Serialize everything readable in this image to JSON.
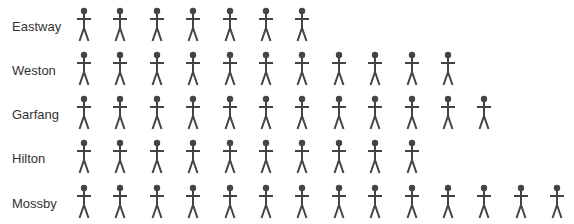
{
  "chart_data": {
    "type": "pictograph",
    "title": "",
    "xlabel": "",
    "ylabel": "",
    "icon": "person-icon",
    "icon_color": "#444444",
    "categories": [
      "Eastway",
      "Weston",
      "Garfang",
      "Hilton",
      "Mossby"
    ],
    "values": [
      7,
      11,
      12,
      10,
      14
    ],
    "legend": null,
    "grid": false
  },
  "rows": [
    {
      "label": "Eastway",
      "count": 7,
      "top": 7
    },
    {
      "label": "Weston",
      "count": 11,
      "top": 51
    },
    {
      "label": "Garfang",
      "count": 12,
      "top": 95
    },
    {
      "label": "Hilton",
      "count": 10,
      "top": 139
    },
    {
      "label": "Mossby",
      "count": 14,
      "top": 184
    }
  ],
  "layout": {
    "icon_start_x": 75,
    "icon_spacing": 36.4
  }
}
